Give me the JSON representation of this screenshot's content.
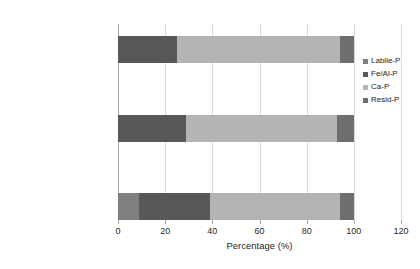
{
  "chart_data": {
    "type": "bar",
    "orientation": "horizontal",
    "stacked": true,
    "title": "",
    "xlabel": "Percentage (%)",
    "ylabel": "",
    "xlim": [
      0,
      120
    ],
    "xticks": [
      0,
      20,
      40,
      60,
      80,
      100,
      120
    ],
    "xtick_labels": [
      "0",
      "20",
      "40",
      "60",
      "80",
      "100",
      "120"
    ],
    "grid": true,
    "legend_position": "right",
    "categories": [
      "0d",
      "60d-control",
      "60d- periphytic biofilm"
    ],
    "categories_top_to_bottom": [
      "60d- periphytic biofilm",
      "60d-control",
      "0d"
    ],
    "series": [
      {
        "name": "Labile-P",
        "color": "#7f7f7f",
        "values": [
          9,
          0,
          0
        ]
      },
      {
        "name": "Fe/Al-P",
        "color": "#585858",
        "values": [
          30,
          29,
          25
        ]
      },
      {
        "name": "Ca-P",
        "color": "#b4b4b4",
        "values": [
          55,
          64,
          69
        ]
      },
      {
        "name": "Resid-P",
        "color": "#6e6e6e",
        "values": [
          6,
          7,
          6
        ]
      }
    ]
  },
  "legend": {
    "items": [
      {
        "label": "Labile-P",
        "color": "#7f7f7f"
      },
      {
        "label": "Fe/Al-P",
        "color": "#585858"
      },
      {
        "label": "Ca-P",
        "color": "#b4b4b4"
      },
      {
        "label": "Resid-P",
        "color": "#6e6e6e"
      }
    ]
  },
  "axes": {
    "x_title": "Percentage (%)",
    "x_tick_labels": [
      "0",
      "20",
      "40",
      "60",
      "80",
      "100",
      "120"
    ],
    "y_tick_labels": [
      "60d- periphytic biofilm",
      "60d-control",
      "0d"
    ]
  }
}
